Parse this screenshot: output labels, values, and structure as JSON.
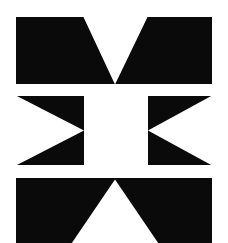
{
  "artwork": {
    "title": "Three Panel Black and White Triangle Composition",
    "canvas": {
      "width": 228,
      "height": 243
    },
    "background_color": "#ffffff",
    "ink_color": "#0a0a0a",
    "paper_color": "#ffffff"
  },
  "panels": [
    {
      "id": "panel-1",
      "name": "downward-triangle-band",
      "label": "Panel 1",
      "description": "Black horizontal band with a white downward pointing triangle notched from the top edge to a point at the bottom edge.",
      "rect": {
        "x": 16,
        "y": 17,
        "width": 196,
        "height": 67
      },
      "fill": "#0a0a0a",
      "shapes": [
        {
          "name": "white-downward-triangle",
          "type": "triangle",
          "fill": "#ffffff",
          "orientation": "down",
          "points": "67,0 132,0 99,67"
        }
      ]
    },
    {
      "id": "panel-2",
      "name": "opposed-triangles-band",
      "label": "Panel 2",
      "description": "Black horizontal band with a white rectangle at the centre and two white triangles pointing inward from the left and right outer edges.",
      "rect": {
        "x": 16,
        "y": 96,
        "width": 196,
        "height": 69
      },
      "fill": "#0a0a0a",
      "shapes": [
        {
          "name": "white-center-rectangle",
          "type": "rect",
          "fill": "#ffffff",
          "points": "68,0 132,0 132,69 68,69"
        },
        {
          "name": "white-left-triangle-pointing-right",
          "type": "triangle",
          "fill": "#ffffff",
          "orientation": "right",
          "points": "0,0 68,34.5 0,69"
        },
        {
          "name": "white-right-triangle-pointing-left",
          "type": "triangle",
          "fill": "#ffffff",
          "orientation": "left",
          "points": "196,0 132,34.5 196,69"
        }
      ]
    },
    {
      "id": "panel-3",
      "name": "upward-triangle-band",
      "label": "Panel 3",
      "description": "Black horizontal band with a white upward pointing triangle rising from the bottom edge to an apex at the top edge, cropped by the lower image border.",
      "rect": {
        "x": 16,
        "y": 178,
        "width": 196,
        "height": 65
      },
      "fill": "#0a0a0a",
      "shapes": [
        {
          "name": "white-upward-triangle",
          "type": "triangle",
          "fill": "#ffffff",
          "orientation": "up",
          "points": "99,2 142,65 56,65"
        }
      ]
    }
  ]
}
